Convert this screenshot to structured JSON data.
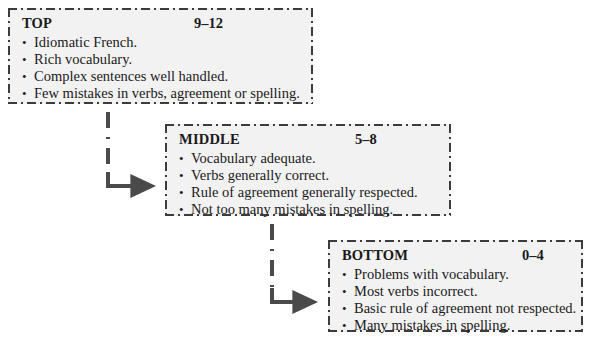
{
  "diagram": {
    "type": "flow-chart",
    "boxes": [
      {
        "id": "top",
        "title": "TOP",
        "score": "9–12",
        "bullets": [
          "Idiomatic French.",
          "Rich vocabulary.",
          "Complex sentences well handled.",
          "Few mistakes in verbs, agreement or spelling."
        ]
      },
      {
        "id": "middle",
        "title": "MIDDLE",
        "score": "5–8",
        "bullets": [
          "Vocabulary adequate.",
          "Verbs generally correct.",
          "Rule of agreement generally respected.",
          "Not too many mistakes in spelling."
        ]
      },
      {
        "id": "bottom",
        "title": "BOTTOM",
        "score": "0–4",
        "bullets": [
          "Problems with vocabulary.",
          "Most verbs incorrect.",
          "Basic rule of agreement not respected.",
          "Many mistakes in spelling."
        ]
      }
    ],
    "connectors": [
      {
        "id": "top-to-middle",
        "from": "top",
        "to": "middle"
      },
      {
        "id": "middle-to-bottom",
        "from": "middle",
        "to": "bottom"
      }
    ],
    "colors": {
      "box_fill": "#f2f2f2",
      "box_border": "#3c3c3c",
      "text": "#1a1a1a",
      "connector": "#4a4a4a",
      "page_background": "#ffffff"
    }
  }
}
